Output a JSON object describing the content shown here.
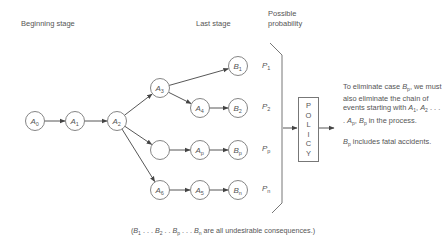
{
  "stage_labels": {
    "beginning": "Beginning stage",
    "last": "Last stage",
    "probability_line1": "Possible",
    "probability_line2": "probability"
  },
  "nodes": [
    {
      "id": "A0",
      "letter": "A",
      "sub": "0"
    },
    {
      "id": "A1",
      "letter": "A",
      "sub": "1"
    },
    {
      "id": "A2",
      "letter": "A",
      "sub": "2"
    },
    {
      "id": "A3",
      "letter": "A",
      "sub": "3"
    },
    {
      "id": "A4",
      "letter": "A",
      "sub": "4"
    },
    {
      "id": "empty",
      "letter": "",
      "sub": ""
    },
    {
      "id": "Ap",
      "letter": "A",
      "sub": "p"
    },
    {
      "id": "A6",
      "letter": "A",
      "sub": "6"
    },
    {
      "id": "A5",
      "letter": "A",
      "sub": "5"
    },
    {
      "id": "B1",
      "letter": "B",
      "sub": "1"
    },
    {
      "id": "B2",
      "letter": "B",
      "sub": "2"
    },
    {
      "id": "Bp",
      "letter": "B",
      "sub": "p"
    },
    {
      "id": "Bn",
      "letter": "B",
      "sub": "n"
    }
  ],
  "edges": [
    [
      "A0",
      "A1"
    ],
    [
      "A1",
      "A2"
    ],
    [
      "A2",
      "A3"
    ],
    [
      "A2",
      "empty"
    ],
    [
      "A2",
      "A6"
    ],
    [
      "A3",
      "B1"
    ],
    [
      "A3",
      "A4"
    ],
    [
      "A4",
      "B2"
    ],
    [
      "empty",
      "Ap"
    ],
    [
      "Ap",
      "Bp"
    ],
    [
      "A6",
      "A5"
    ],
    [
      "A5",
      "Bn"
    ]
  ],
  "probabilities": [
    {
      "letter": "P",
      "sub": "1"
    },
    {
      "letter": "P",
      "sub": "2"
    },
    {
      "letter": "P",
      "sub": "p"
    },
    {
      "letter": "P",
      "sub": "n"
    }
  ],
  "policy_letters": [
    "P",
    "O",
    "L",
    "I",
    "C",
    "Y"
  ],
  "note": {
    "p1_a": "To eliminate case ",
    "p1_b": "B",
    "p1_b_sub": "p",
    "p1_c": ", we must also eliminate the chain of events starting with ",
    "p1_d": "A",
    "p1_d_sub": "1",
    "p1_e": ", ",
    "p1_f": "A",
    "p1_f_sub": "2",
    "p1_g": " . . . . ",
    "p1_h": "A",
    "p1_h_sub": "p",
    "p1_i": ", ",
    "p1_j": "B",
    "p1_j_sub": "p",
    "p1_k": " in the process.",
    "p2_a": "B",
    "p2_a_sub": "p",
    "p2_b": " includes fatal accidents."
  },
  "footer": {
    "open": "(",
    "b1": "B",
    "b1_sub": "1",
    "dots1": " . . . ",
    "b2": "B",
    "b2_sub": "2",
    "dots2": " . . ",
    "bp": "B",
    "bp_sub": "p",
    "dots3": " . . . ",
    "bn": "B",
    "bn_sub": "n",
    "rest": " are all undesirable consequences.)"
  }
}
